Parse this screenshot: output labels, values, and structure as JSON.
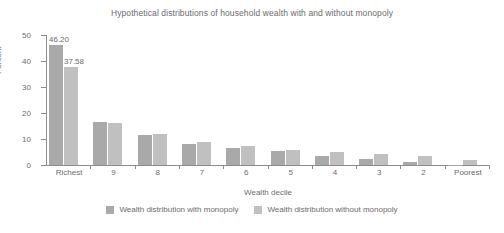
{
  "chart_data": {
    "type": "bar",
    "title": "Hypothetical distributions of household wealth with and without monopoly",
    "xlabel": "Wealth decile",
    "ylabel": "Percent",
    "categories": [
      "Richest",
      "9",
      "8",
      "7",
      "6",
      "5",
      "4",
      "3",
      "2",
      "Poorest"
    ],
    "yticks": [
      0,
      10,
      20,
      30,
      40,
      50
    ],
    "ylim": [
      0,
      50
    ],
    "grid": false,
    "legend_position": "bottom",
    "series": [
      {
        "name": "Wealth distribution with monopoly",
        "color": "#a9a9aa",
        "values": [
          46.2,
          16.4,
          11.4,
          8.2,
          6.6,
          5.3,
          3.6,
          2.4,
          1.0,
          0.1
        ]
      },
      {
        "name": "Wealth distribution without monopoly",
        "color": "#c0c0c1",
        "values": [
          37.58,
          16.0,
          12.0,
          8.8,
          7.2,
          5.9,
          5.0,
          4.3,
          3.4,
          2.1
        ]
      }
    ],
    "data_labels": [
      {
        "text": "46.20",
        "series": 0,
        "category": "Richest"
      },
      {
        "text": "37.58",
        "series": 1,
        "category": "Richest"
      }
    ]
  }
}
